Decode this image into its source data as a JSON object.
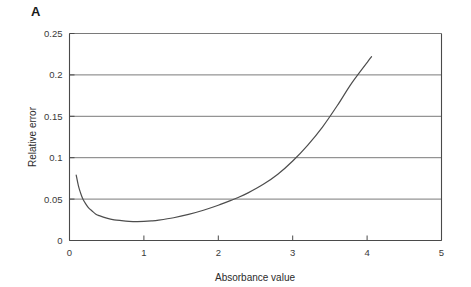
{
  "panel": {
    "label": "A"
  },
  "chart_data": {
    "type": "line",
    "title": "",
    "xlabel": "Absorbance value",
    "ylabel": "Relative error",
    "xlim": [
      0,
      5
    ],
    "ylim": [
      0,
      0.25
    ],
    "xticks": [
      0,
      1,
      2,
      3,
      4,
      5
    ],
    "xticklabels": [
      "0",
      "1",
      "2",
      "3",
      "4",
      "5"
    ],
    "yticks": [
      0,
      0.05,
      0.1,
      0.15,
      0.2,
      0.25
    ],
    "yticklabels": [
      "0",
      "0.05",
      "0.1",
      "0.15",
      "0.2",
      "0.25"
    ],
    "grid": "horizontal",
    "grid_color": "#7a7a7a",
    "legend": "none",
    "line_color": "#4d4d4d",
    "series": [
      {
        "name": "Relative error vs absorbance",
        "x": [
          0.09,
          0.12,
          0.15,
          0.18,
          0.22,
          0.26,
          0.3,
          0.35,
          0.4,
          0.5,
          0.6,
          0.7,
          0.8,
          0.9,
          1.0,
          1.1,
          1.2,
          1.4,
          1.6,
          1.8,
          2.0,
          2.2,
          2.25,
          2.4,
          2.6,
          2.8,
          3.0,
          3.2,
          3.4,
          3.6,
          3.8,
          4.06
        ],
        "y": [
          0.079,
          0.066,
          0.057,
          0.05,
          0.044,
          0.039,
          0.036,
          0.032,
          0.03,
          0.027,
          0.025,
          0.024,
          0.0232,
          0.0228,
          0.023,
          0.0236,
          0.0246,
          0.0275,
          0.0315,
          0.0365,
          0.0425,
          0.0495,
          0.0513,
          0.0575,
          0.0675,
          0.08,
          0.096,
          0.115,
          0.137,
          0.163,
          0.191,
          0.222
        ]
      }
    ],
    "annotations": []
  }
}
